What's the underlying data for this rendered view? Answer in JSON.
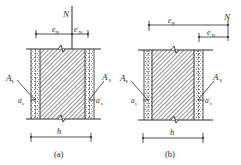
{
  "figure": {
    "panels": [
      {
        "id": "a",
        "caption": "(a)",
        "force_label": "N",
        "ecc_label": "e",
        "ecc_sub": "N",
        "ecc_prime_label": "e",
        "ecc_prime_sup": "′",
        "ecc_prime_sub": "N",
        "steel_left_label": "A",
        "steel_left_sub": "s",
        "steel_right_label": "A",
        "steel_right_sup": "′",
        "steel_right_sub": "s",
        "cover_left_label": "a",
        "cover_left_sub": "s",
        "cover_right_label": "a",
        "cover_right_sup": "′",
        "cover_right_sub": "s",
        "width_label": "h",
        "force_position": "between reinforcement (small eccentricity)"
      },
      {
        "id": "b",
        "caption": "(b)",
        "force_label": "N",
        "ecc_label": "e",
        "ecc_sub": "N",
        "ecc_prime_label": "e",
        "ecc_prime_sup": "′",
        "ecc_prime_sub": "N",
        "steel_left_label": "A",
        "steel_left_sub": "s",
        "steel_right_label": "A",
        "steel_right_sup": "′",
        "steel_right_sub": "s",
        "cover_left_label": "a",
        "cover_left_sub": "s",
        "cover_right_label": "a",
        "cover_right_sup": "′",
        "cover_right_sub": "s",
        "width_label": "h",
        "force_position": "outside reinforcement (large eccentricity)"
      }
    ],
    "colors": {
      "ink": "#2a2a2a",
      "background": "#ffffff"
    }
  }
}
